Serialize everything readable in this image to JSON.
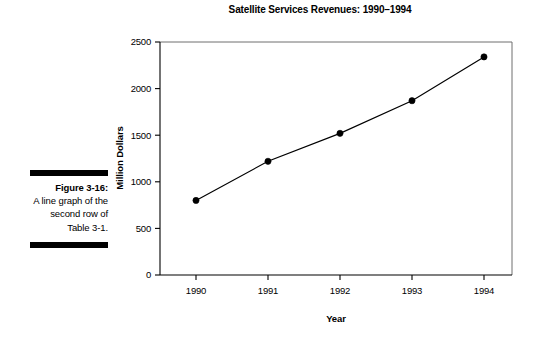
{
  "figure": {
    "label": "Figure 3-16:",
    "body": "A line graph of the second row of Table 3-1."
  },
  "chart_data": {
    "type": "line",
    "title": "Satellite Services Revenues: 1990–1994",
    "xlabel": "Year",
    "ylabel": "Million Dollars",
    "categories": [
      "1990",
      "1991",
      "1992",
      "1993",
      "1994"
    ],
    "values": [
      800,
      1220,
      1520,
      1870,
      2340
    ],
    "x_tick_labels": [
      "1990",
      "1991",
      "1992",
      "1993",
      "1994"
    ],
    "y_tick_labels": [
      "0",
      "500",
      "1000",
      "1500",
      "2000",
      "2500"
    ],
    "y_ticks": [
      0,
      500,
      1000,
      1500,
      2000,
      2500
    ],
    "ylim": [
      0,
      2500
    ],
    "grid": false,
    "legend": false,
    "marker": "filled-circle",
    "line_color": "#000000",
    "marker_color": "#000000"
  }
}
